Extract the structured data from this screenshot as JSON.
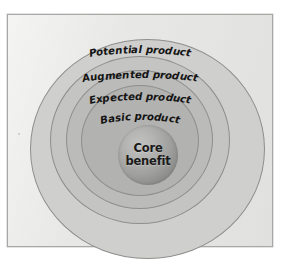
{
  "figure": {
    "name": "five-product-levels-diagram",
    "type": "concentric-circles",
    "background_color": "#ffffff",
    "frame_color": "#ececeb",
    "frame_border_color": "#a8a8a6"
  },
  "rings": [
    {
      "id": "potential",
      "label": "Potential product",
      "fill": "#cfcfcd",
      "order": 1
    },
    {
      "id": "augmented",
      "label": "Augmented product",
      "fill": "#c4c4c2",
      "order": 2
    },
    {
      "id": "expected",
      "label": "Expected product",
      "fill": "#bbbbb9",
      "order": 3
    },
    {
      "id": "basic",
      "label": "Basic product",
      "fill": "#b2b2b0",
      "order": 4
    }
  ],
  "core": {
    "line1": "Core",
    "line2": "benefit",
    "fill": "#9f9f9d"
  }
}
